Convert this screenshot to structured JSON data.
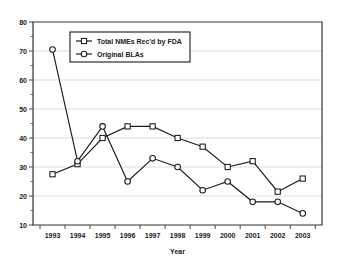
{
  "chart_data": {
    "type": "line",
    "title": "",
    "xlabel": "Year",
    "ylabel": "",
    "categories": [
      "1993",
      "1994",
      "1995",
      "1996",
      "1997",
      "1998",
      "1999",
      "2000",
      "2001",
      "2002",
      "2003"
    ],
    "series": [
      {
        "name": "Total NMEs Rec'd by FDA",
        "marker": "square",
        "values": [
          27.5,
          31,
          40,
          44,
          44,
          40,
          37,
          30,
          32,
          21.5,
          26
        ]
      },
      {
        "name": "Original BLAs",
        "marker": "circle",
        "values": [
          70.5,
          32,
          44,
          25,
          33,
          30,
          22,
          25,
          18,
          18,
          14
        ]
      }
    ],
    "ylim": [
      10,
      80
    ],
    "ytick_labels": [
      "10",
      "20",
      "30",
      "40",
      "50",
      "60",
      "70",
      "80"
    ],
    "ytick_values": [
      10,
      20,
      30,
      40,
      50,
      60,
      70,
      80
    ],
    "yminor_step": 5,
    "grid": "horizontal",
    "legend_position": "upper-left-inside",
    "colors": {
      "line": "#1a1a1a",
      "grid": "#c8c8c8",
      "axis": "#333333",
      "background": "#ffffff"
    }
  },
  "legend": {
    "entries": [
      {
        "label": "Total NMEs Rec'd by FDA",
        "marker": "square"
      },
      {
        "label": "Original BLAs",
        "marker": "circle"
      }
    ]
  },
  "axes": {
    "x_title": "Year",
    "y_title": ""
  }
}
